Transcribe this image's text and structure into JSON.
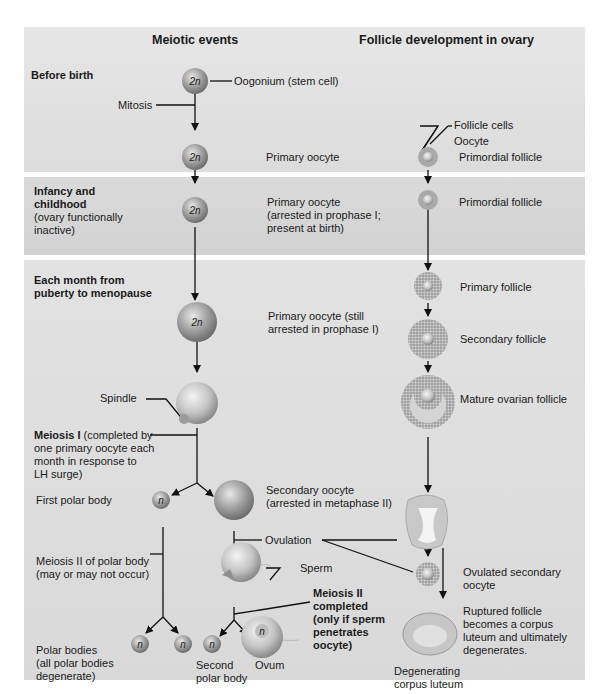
{
  "headers": {
    "meiotic": "Meiotic events",
    "follicle": "Follicle development in ovary"
  },
  "stages": {
    "before_birth": "Before birth",
    "infancy_title": "Infancy and childhood",
    "infancy_l1": "Infancy and",
    "infancy_l2": "childhood",
    "infancy_note_l1": "(ovary functionally",
    "infancy_note_l2": "inactive)",
    "puberty_l1": "Each month from",
    "puberty_l2": "puberty to menopause"
  },
  "cell_labels": {
    "diploid": "2n",
    "haploid": "n"
  },
  "meiotic": {
    "oogonium": "Oogonium (stem cell)",
    "mitosis": "Mitosis",
    "primary_oocyte": "Primary oocyte",
    "primary_arrested_l1": "Primary oocyte",
    "primary_arrested_l2": "(arrested in prophase I;",
    "primary_arrested_l3": "present at birth)",
    "primary_still_l1": "Primary oocyte (still",
    "primary_still_l2": "arrested in prophase I)",
    "spindle": "Spindle",
    "meiosis1_bold": "Meiosis I",
    "meiosis1_l1": " (completed by",
    "meiosis1_l2": "one primary oocyte each",
    "meiosis1_l3": "month in response to",
    "meiosis1_l4": "LH surge)",
    "first_polar": "First polar body",
    "secondary_l1": "Secondary oocyte",
    "secondary_l2": "(arrested in metaphase II)",
    "ovulation": "Ovulation",
    "sperm": "Sperm",
    "meiosis2_polar_l1": "Meiosis II of polar body",
    "meiosis2_polar_l2": "(may or may not occur)",
    "meiosis2_done_l1": "Meiosis II",
    "meiosis2_done_l2": "completed",
    "meiosis2_done_l3": "(only if sperm",
    "meiosis2_done_l4": "penetrates",
    "meiosis2_done_l5": "oocyte)",
    "polar_bodies_l1": "Polar bodies",
    "polar_bodies_l2": "(all polar bodies",
    "polar_bodies_l3": "degenerate)",
    "second_polar_l1": "Second",
    "second_polar_l2": "polar body",
    "ovum": "Ovum"
  },
  "follicle": {
    "follicle_cells": "Follicle cells",
    "oocyte": "Oocyte",
    "primordial": "Primordial follicle",
    "primordial2": "Primordial follicle",
    "primary": "Primary follicle",
    "secondary": "Secondary follicle",
    "mature": "Mature ovarian follicle",
    "ovulated_l1": "Ovulated secondary",
    "ovulated_l2": "oocyte",
    "ruptured_l1": "Ruptured follicle",
    "ruptured_l2": "becomes a corpus",
    "ruptured_l3": "luteum and ultimately",
    "ruptured_l4": "degenerates.",
    "degenerating_l1": "Degenerating",
    "degenerating_l2": "corpus luteum"
  },
  "colors": {
    "band_light": "#e4e4e4",
    "band_dark": "#d6d6d6",
    "cell": "#9a9a9a",
    "text": "#1a1a1a"
  }
}
